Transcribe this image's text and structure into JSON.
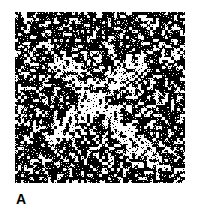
{
  "figure": {
    "panel_label": "A",
    "colors": {
      "background": "#ffffff",
      "noise_dark": "#000000",
      "noise_light": "#ffffff"
    },
    "panel": {
      "x": 15,
      "y": 12,
      "width": 170,
      "height": 171
    },
    "hidden_shape": {
      "type": "X",
      "stroke_1": {
        "from": [
          47,
          50
        ],
        "to": [
          133,
          146
        ]
      },
      "stroke_2": {
        "from": [
          45,
          120
        ],
        "to": [
          120,
          53
        ]
      },
      "stroke_width": 22,
      "white_density_inside": 0.72,
      "white_density_outside": 0.28
    }
  }
}
